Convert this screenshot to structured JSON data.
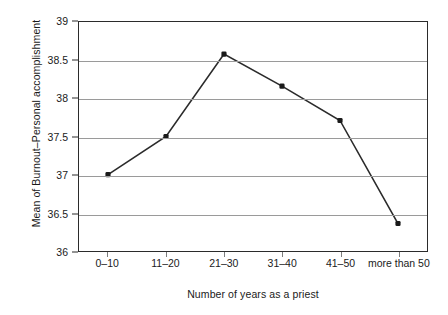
{
  "chart_data": {
    "type": "line",
    "title": "",
    "xlabel": "Number of years as a priest",
    "ylabel": "Mean of Burnout–Personal accomplishment",
    "categories": [
      "0–10",
      "11–20",
      "21–30",
      "31–40",
      "41–50",
      "more than 50"
    ],
    "values": [
      37.0,
      37.5,
      38.58,
      38.16,
      37.71,
      36.36
    ],
    "series": [
      {
        "name": "Mean of Burnout–Personal accomplishment",
        "values": [
          37.0,
          37.5,
          38.58,
          38.16,
          37.71,
          36.36
        ]
      }
    ],
    "ylim": [
      36,
      39
    ],
    "yticks": [
      "36",
      "36.5",
      "37",
      "37.5",
      "38",
      "38.5",
      "39"
    ],
    "ytick_values": [
      36,
      36.5,
      37,
      37.5,
      38,
      38.5,
      39
    ],
    "grid": true,
    "grid_axis": "y",
    "legend": false,
    "legend_position": "none",
    "marker": "filled-diamond",
    "line_color": "#2b2b2b",
    "marker_color": "#1a1a1a",
    "grid_color": "#9a9a9a",
    "axis_color": "#2b2b2b",
    "background_color": "#ffffff"
  },
  "axes": {
    "y_title": "Mean of Burnout–Personal accomplishment",
    "x_title": "Number of years as a priest"
  }
}
